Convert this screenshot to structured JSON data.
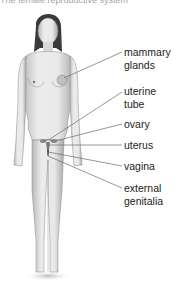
{
  "title": "The female reproductive system",
  "labels": [
    {
      "id": "mammary-glands",
      "lines": [
        "mammary",
        "glands"
      ],
      "top": 46
    },
    {
      "id": "uterine-tube",
      "lines": [
        "uterine",
        "tube"
      ],
      "top": 85
    },
    {
      "id": "ovary",
      "lines": [
        "ovary"
      ],
      "top": 118
    },
    {
      "id": "uterus",
      "lines": [
        "uterus"
      ],
      "top": 139
    },
    {
      "id": "vagina",
      "lines": [
        "vagina"
      ],
      "top": 160
    },
    {
      "id": "external-genitalia",
      "lines": [
        "external",
        "genitalia"
      ],
      "top": 182
    }
  ],
  "colors": {
    "skin": "#e6e6e6",
    "shade": "#9a9a9a",
    "hair": "#3a3a3a",
    "line": "#6a6a6a",
    "text": "#222222"
  }
}
